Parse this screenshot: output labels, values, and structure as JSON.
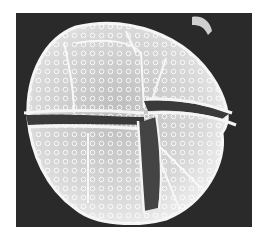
{
  "image": {
    "subject": "SEM micrograph of a dinoflagellate cyst",
    "colors": {
      "background": "#ffffff",
      "panel": "#2a2a2a",
      "cyst_fill": "#cfcfcf",
      "cyst_edge": "#f2f2f2",
      "groove": "#3a3a3a",
      "reticulum": "#ffffff"
    }
  }
}
